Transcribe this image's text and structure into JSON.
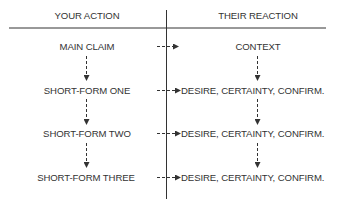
{
  "header": {
    "left_title": "YOUR ACTION",
    "right_title": "THEIR REACTION"
  },
  "rows": [
    {
      "action": "MAIN CLAIM",
      "reaction": "CONTEXT"
    },
    {
      "action": "SHORT-FORM ONE",
      "reaction": "DESIRE, CERTAINTY, CONFIRM."
    },
    {
      "action": "SHORT-FORM TWO",
      "reaction": "DESIRE, CERTAINTY, CONFIRM."
    },
    {
      "action": "SHORT-FORM THREE",
      "reaction": "DESIRE, CERTAINTY, CONFIRM."
    }
  ],
  "colors": {
    "line": "#333333",
    "text": "#333333"
  }
}
